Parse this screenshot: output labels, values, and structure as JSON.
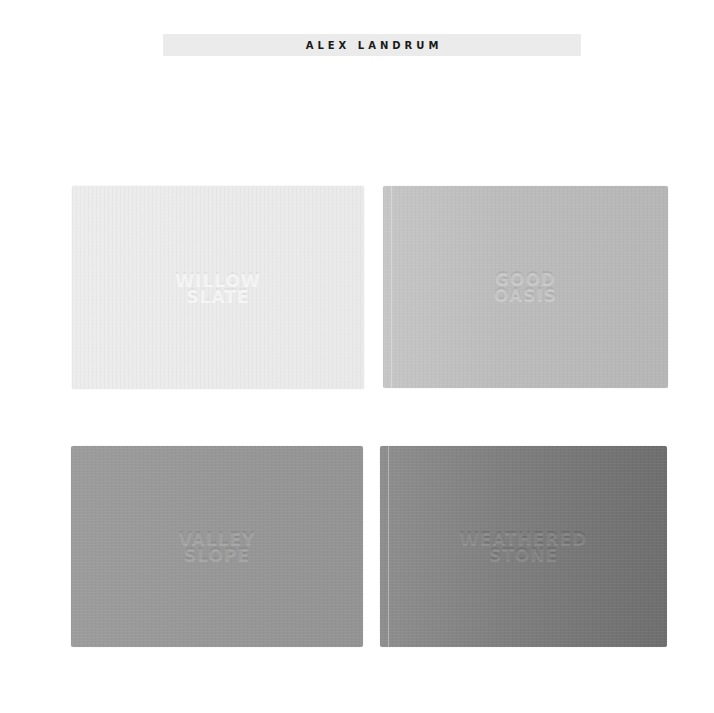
{
  "header": {
    "title": "ALEX LANDRUM"
  },
  "swatches": [
    {
      "embossed_text": "WILLOW\nSLATE",
      "tone": "light",
      "color": "#ebebeb"
    },
    {
      "embossed_text": "GOOD\nOASIS",
      "tone": "light-gray",
      "color": "#bdbdbd"
    },
    {
      "embossed_text": "VALLEY\nSLOPE",
      "tone": "mid-gray",
      "color": "#979797"
    },
    {
      "embossed_text": "WEATHERED\nSTONE",
      "tone": "dark-gray",
      "color": "#7e7e7e"
    }
  ]
}
